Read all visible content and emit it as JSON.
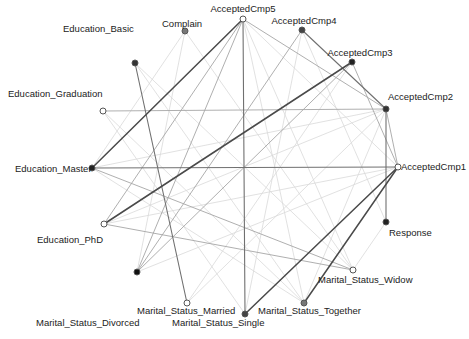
{
  "chart_data": {
    "type": "network",
    "layout": "circular",
    "title": "",
    "nodes": [
      {
        "id": "AcceptedCmp5",
        "label": "AcceptedCmp5",
        "x": 243,
        "y": 19,
        "fill": "#ffffff",
        "lx": 243,
        "ly": 12,
        "anchor": "middle"
      },
      {
        "id": "AcceptedCmp4",
        "label": "AcceptedCmp4",
        "x": 302,
        "y": 30,
        "fill": "#444444",
        "lx": 304,
        "ly": 24,
        "anchor": "middle"
      },
      {
        "id": "AcceptedCmp3",
        "label": "AcceptedCmp3",
        "x": 352,
        "y": 62,
        "fill": "#222222",
        "lx": 360,
        "ly": 56,
        "anchor": "middle"
      },
      {
        "id": "AcceptedCmp2",
        "label": "AcceptedCmp2",
        "x": 386,
        "y": 109,
        "fill": "#333333",
        "lx": 388,
        "ly": 100,
        "anchor": "start"
      },
      {
        "id": "AcceptedCmp1",
        "label": "AcceptedCmp1",
        "x": 398,
        "y": 167,
        "fill": "#ffffff",
        "lx": 401,
        "ly": 170,
        "anchor": "start"
      },
      {
        "id": "Response",
        "label": "Response",
        "x": 386,
        "y": 222,
        "fill": "#222222",
        "lx": 389,
        "ly": 236,
        "anchor": "start"
      },
      {
        "id": "Marital_Status_Widow",
        "label": "Marital_Status_Widow",
        "x": 353,
        "y": 270,
        "fill": "#ffffff",
        "lx": 318,
        "ly": 283,
        "anchor": "start"
      },
      {
        "id": "Marital_Status_Together",
        "label": "Marital_Status_Together",
        "x": 304,
        "y": 303,
        "fill": "#777777",
        "lx": 258,
        "ly": 314,
        "anchor": "start"
      },
      {
        "id": "Marital_Status_Single",
        "label": "Marital_Status_Single",
        "x": 245,
        "y": 314,
        "fill": "#444444",
        "lx": 172,
        "ly": 326,
        "anchor": "start"
      },
      {
        "id": "Marital_Status_Married",
        "label": "Marital_Status_Married",
        "x": 187,
        "y": 303,
        "fill": "#ffffff",
        "lx": 137,
        "ly": 314,
        "anchor": "start"
      },
      {
        "id": "Marital_Status_Divorced",
        "label": "Marital_Status_Divorced",
        "x": 137,
        "y": 272,
        "fill": "#111111",
        "lx": 36,
        "ly": 326,
        "anchor": "start"
      },
      {
        "id": "Education_PhD",
        "label": "Education_PhD",
        "x": 104,
        "y": 224,
        "fill": "#ffffff",
        "lx": 37,
        "ly": 243,
        "anchor": "start"
      },
      {
        "id": "Education_Master",
        "label": "Education_Master",
        "x": 92,
        "y": 168,
        "fill": "#222222",
        "lx": 15,
        "ly": 172,
        "anchor": "start"
      },
      {
        "id": "Education_Graduation",
        "label": "Education_Graduation",
        "x": 103,
        "y": 111,
        "fill": "#ffffff",
        "lx": 8,
        "ly": 97,
        "anchor": "start"
      },
      {
        "id": "Education_Basic",
        "label": "Education_Basic",
        "x": 135,
        "y": 63,
        "fill": "#333333",
        "lx": 63,
        "ly": 32,
        "anchor": "start"
      },
      {
        "id": "Complain",
        "label": "Complain",
        "x": 185,
        "y": 31,
        "fill": "#777777",
        "lx": 162,
        "ly": 27,
        "anchor": "start"
      }
    ],
    "edges": [
      {
        "source": "AcceptedCmp5",
        "target": "Education_Master",
        "weight": 3
      },
      {
        "source": "AcceptedCmp5",
        "target": "Marital_Status_Single",
        "weight": 2
      },
      {
        "source": "AcceptedCmp5",
        "target": "Education_PhD",
        "weight": 1
      },
      {
        "source": "AcceptedCmp5",
        "target": "Marital_Status_Divorced",
        "weight": 1
      },
      {
        "source": "AcceptedCmp5",
        "target": "AcceptedCmp2",
        "weight": 1
      },
      {
        "source": "AcceptedCmp5",
        "target": "AcceptedCmp1",
        "weight": 0
      },
      {
        "source": "AcceptedCmp5",
        "target": "Marital_Status_Widow",
        "weight": 0
      },
      {
        "source": "AcceptedCmp5",
        "target": "Marital_Status_Together",
        "weight": 0
      },
      {
        "source": "AcceptedCmp4",
        "target": "AcceptedCmp2",
        "weight": 2
      },
      {
        "source": "AcceptedCmp4",
        "target": "Marital_Status_Divorced",
        "weight": 1
      },
      {
        "source": "AcceptedCmp4",
        "target": "Marital_Status_Single",
        "weight": 0
      },
      {
        "source": "AcceptedCmp4",
        "target": "Response",
        "weight": 0
      },
      {
        "source": "AcceptedCmp3",
        "target": "Education_PhD",
        "weight": 3
      },
      {
        "source": "AcceptedCmp3",
        "target": "AcceptedCmp1",
        "weight": 1
      },
      {
        "source": "AcceptedCmp3",
        "target": "Marital_Status_Divorced",
        "weight": 1
      },
      {
        "source": "AcceptedCmp3",
        "target": "Marital_Status_Married",
        "weight": 0
      },
      {
        "source": "AcceptedCmp2",
        "target": "Education_Graduation",
        "weight": 1
      },
      {
        "source": "AcceptedCmp2",
        "target": "Response",
        "weight": 2
      },
      {
        "source": "AcceptedCmp2",
        "target": "AcceptedCmp1",
        "weight": 1
      },
      {
        "source": "AcceptedCmp2",
        "target": "Education_Master",
        "weight": 0
      },
      {
        "source": "AcceptedCmp2",
        "target": "Marital_Status_Together",
        "weight": 0
      },
      {
        "source": "AcceptedCmp2",
        "target": "Education_PhD",
        "weight": 0
      },
      {
        "source": "AcceptedCmp1",
        "target": "Education_Master",
        "weight": 2
      },
      {
        "source": "AcceptedCmp1",
        "target": "Marital_Status_Single",
        "weight": 3
      },
      {
        "source": "AcceptedCmp1",
        "target": "Marital_Status_Together",
        "weight": 3
      },
      {
        "source": "AcceptedCmp1",
        "target": "Marital_Status_Divorced",
        "weight": 0
      },
      {
        "source": "AcceptedCmp1",
        "target": "Education_PhD",
        "weight": 0
      },
      {
        "source": "Response",
        "target": "Marital_Status_Widow",
        "weight": 0
      },
      {
        "source": "Marital_Status_Widow",
        "target": "Education_Master",
        "weight": 1
      },
      {
        "source": "Marital_Status_Widow",
        "target": "Education_PhD",
        "weight": 1
      },
      {
        "source": "Education_Basic",
        "target": "Marital_Status_Married",
        "weight": 2
      },
      {
        "source": "Education_Basic",
        "target": "Marital_Status_Widow",
        "weight": 0
      },
      {
        "source": "Education_Basic",
        "target": "Marital_Status_Together",
        "weight": 0
      },
      {
        "source": "Complain",
        "target": "Marital_Status_Divorced",
        "weight": 0
      },
      {
        "source": "Complain",
        "target": "Education_Master",
        "weight": 0
      },
      {
        "source": "Complain",
        "target": "Marital_Status_Widow",
        "weight": 0
      },
      {
        "source": "Education_Graduation",
        "target": "Marital_Status_Together",
        "weight": 0
      },
      {
        "source": "Education_Master",
        "target": "Marital_Status_Together",
        "weight": 0
      },
      {
        "source": "Marital_Status_Married",
        "target": "AcceptedCmp2",
        "weight": 0
      },
      {
        "source": "Marital_Status_Single",
        "target": "Education_Graduation",
        "weight": 0
      }
    ],
    "edge_styles": {
      "0": {
        "stroke": "#d9d9d9",
        "width": 0.8
      },
      "1": {
        "stroke": "#a6a6a6",
        "width": 0.9
      },
      "2": {
        "stroke": "#707070",
        "width": 1.1
      },
      "3": {
        "stroke": "#4a4a4a",
        "width": 1.5
      }
    },
    "node_radius": 3,
    "node_stroke": "#555555",
    "legend": null,
    "axes": null
  }
}
